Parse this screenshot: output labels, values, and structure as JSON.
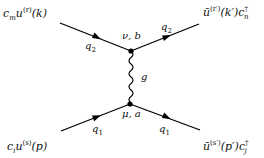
{
  "diagram": {
    "type": "feynman-diagram",
    "external_legs": {
      "top_left": {
        "base": "c",
        "base_sub": "m",
        "spinor": "u",
        "spinor_sup": "(r)",
        "arg": "(k)"
      },
      "top_right": {
        "spinor": "ū",
        "spinor_sup": "(r′)",
        "arg": "(k′)",
        "base": "c",
        "base_sup": "†",
        "base_sub": "n"
      },
      "bottom_left": {
        "base": "c",
        "base_sub": "i",
        "spinor": "u",
        "spinor_sup": "(s)",
        "arg": "(p)"
      },
      "bottom_right": {
        "spinor": "ū",
        "spinor_sup": "(s′)",
        "arg": "(p′)",
        "base": "c",
        "base_sup": "†",
        "base_sub": "j"
      }
    },
    "momentum_labels": {
      "top_in": {
        "base": "q",
        "sub": "2"
      },
      "top_out": {
        "base": "q",
        "sub": "2"
      },
      "bottom_in": {
        "base": "q",
        "sub": "1"
      },
      "bottom_out": {
        "base": "q",
        "sub": "1"
      }
    },
    "vertices": {
      "top": {
        "label": "ν, b"
      },
      "bottom": {
        "label": "μ, a"
      }
    },
    "propagator": {
      "label": "g",
      "kind": "gluon"
    },
    "colors": {
      "line": "#000000",
      "text": "#111111"
    }
  }
}
